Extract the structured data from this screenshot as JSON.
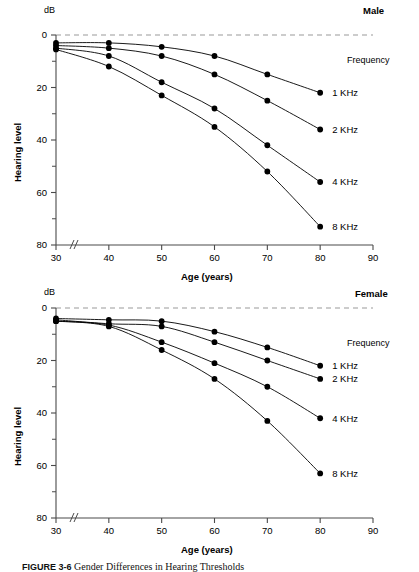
{
  "figure": {
    "caption_number": "FIGURE 3-6",
    "caption_text": "Gender Differences in Hearing Thresholds",
    "caption_full": "FIGURE 3-6   Gender Differences in Hearing Thresholds"
  },
  "panels": [
    {
      "id": "male",
      "sex_label": "Male",
      "unit_label": "dB",
      "legend_title": "Frequency",
      "x_axis_title": "Age (years)",
      "y_axis_title": "Hearing level",
      "axis_break_marker": "//",
      "x_ticks": [
        "30",
        "40",
        "50",
        "60",
        "70",
        "80",
        "90"
      ],
      "y_ticks": [
        "0",
        "20",
        "40",
        "60",
        "80"
      ],
      "series_labels": [
        "1 KHz",
        "2 KHz",
        "4 KHz",
        "8 KHz"
      ]
    },
    {
      "id": "female",
      "sex_label": "Female",
      "unit_label": "dB",
      "legend_title": "Frequency",
      "x_axis_title": "Age (years)",
      "y_axis_title": "Hearing level",
      "axis_break_marker": "//",
      "x_ticks": [
        "30",
        "40",
        "50",
        "60",
        "70",
        "80",
        "90"
      ],
      "y_ticks": [
        "0",
        "20",
        "40",
        "60",
        "80"
      ],
      "series_labels": [
        "1 KHz",
        "2 KHz",
        "4 KHz",
        "8 KHz"
      ]
    }
  ],
  "chart_data": [
    {
      "type": "line",
      "title": "Male",
      "xlabel": "Age (years)",
      "ylabel": "Hearing level",
      "yunit": "dB",
      "xlim": [
        30,
        90
      ],
      "ylim": [
        0,
        80
      ],
      "y_inverted": true,
      "grid": false,
      "legend_position": "right",
      "legend_title": "Frequency",
      "x": [
        30,
        40,
        50,
        60,
        70,
        80
      ],
      "x_ticks": [
        30,
        40,
        50,
        60,
        70,
        80,
        90
      ],
      "y_ticks": [
        0,
        20,
        40,
        60,
        80
      ],
      "y_minor_ticks": [
        10,
        30,
        50,
        70
      ],
      "reference_line": {
        "y": 0,
        "style": "dashed",
        "color": "#999999"
      },
      "series": [
        {
          "name": "1 KHz",
          "values": [
            3,
            3,
            4.5,
            8,
            15,
            22
          ]
        },
        {
          "name": "2 KHz",
          "values": [
            4,
            5,
            8,
            15,
            25,
            36
          ]
        },
        {
          "name": "4 KHz",
          "values": [
            5,
            8,
            18,
            28,
            42,
            56
          ]
        },
        {
          "name": "8 KHz",
          "values": [
            5.5,
            12,
            23,
            35,
            52,
            73
          ]
        }
      ]
    },
    {
      "type": "line",
      "title": "Female",
      "xlabel": "Age (years)",
      "ylabel": "Hearing level",
      "yunit": "dB",
      "xlim": [
        30,
        90
      ],
      "ylim": [
        0,
        80
      ],
      "y_inverted": true,
      "grid": false,
      "legend_position": "right",
      "legend_title": "Frequency",
      "x": [
        30,
        40,
        50,
        60,
        70,
        80
      ],
      "x_ticks": [
        30,
        40,
        50,
        60,
        70,
        80,
        90
      ],
      "y_ticks": [
        0,
        20,
        40,
        60,
        80
      ],
      "y_minor_ticks": [
        10,
        30,
        50,
        70
      ],
      "reference_line": {
        "y": 0,
        "style": "dashed",
        "color": "#999999"
      },
      "series": [
        {
          "name": "1 KHz",
          "values": [
            4,
            4.5,
            5,
            9,
            15,
            22
          ]
        },
        {
          "name": "2 KHz",
          "values": [
            4.5,
            6,
            7,
            13,
            20,
            27
          ]
        },
        {
          "name": "4 KHz",
          "values": [
            5,
            6.5,
            13,
            21,
            30,
            42
          ]
        },
        {
          "name": "8 KHz",
          "values": [
            5,
            7,
            16,
            27,
            43,
            63
          ]
        }
      ]
    }
  ],
  "colors": {
    "line": "#000000",
    "marker": "#000000",
    "axis": "#4a4a4a",
    "reference_dash": "#9a9a9a",
    "text": "#000000"
  }
}
